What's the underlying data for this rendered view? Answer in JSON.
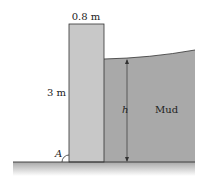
{
  "diagram": {
    "labels": {
      "wall_width": "0.8 m",
      "wall_height": "3 m",
      "mud_depth": "h",
      "mud": "Mud",
      "pivot_point": "A"
    },
    "colors": {
      "wall_fill": "#c8c8c8",
      "mud_fill": "#a9a9a9",
      "outline": "#333333",
      "ground_shadow": "#bdbdbd"
    }
  }
}
